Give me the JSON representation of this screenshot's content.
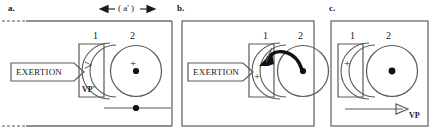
{
  "figure": {
    "scale_annotation": "( a' )",
    "panels": [
      {
        "letter": "a.",
        "box_label_1": "1",
        "box_label_2": "2",
        "exertion_label": "EXERTION",
        "vp_label": "VP'",
        "gt_symbol": ">",
        "plus_symbol": "+"
      },
      {
        "letter": "b.",
        "box_label_1": "1",
        "box_label_2": "2",
        "exertion_label": "EXERTION",
        "plus_symbol": "+"
      },
      {
        "letter": "c.",
        "box_label_1": "1",
        "box_label_2": "2",
        "vp_label": "VP",
        "plus_symbol": "+"
      }
    ]
  },
  "colors": {
    "stroke": "#4a4a4a",
    "ink": "#1a1a1a",
    "background": "#ffffff",
    "heavy": "#111111"
  }
}
